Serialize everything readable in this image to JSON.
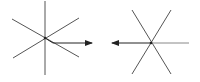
{
  "diagram": {
    "background": "#ffffff",
    "line_color": "#555555",
    "arrow_color": "#222222",
    "figures": [
      {
        "name": "left-star",
        "center": [
          45,
          38
        ],
        "lines": [
          [
            45,
            1,
            45,
            75
          ],
          [
            12,
            19,
            79,
            57
          ],
          [
            13,
            58,
            79,
            18
          ]
        ],
        "arrow": {
          "from": [
            45,
            38
          ],
          "via": [
            53,
            43
          ],
          "to": [
            92,
            43
          ],
          "direction": "right"
        }
      },
      {
        "name": "right-star",
        "center": [
          151,
          43
        ],
        "lines": [
          [
            132,
            10,
            171,
            74
          ],
          [
            171,
            10,
            132,
            74
          ],
          [
            151,
            43,
            189,
            43
          ]
        ],
        "arrow": {
          "from": [
            151,
            43
          ],
          "to": [
            112,
            43
          ],
          "direction": "left"
        }
      }
    ]
  }
}
